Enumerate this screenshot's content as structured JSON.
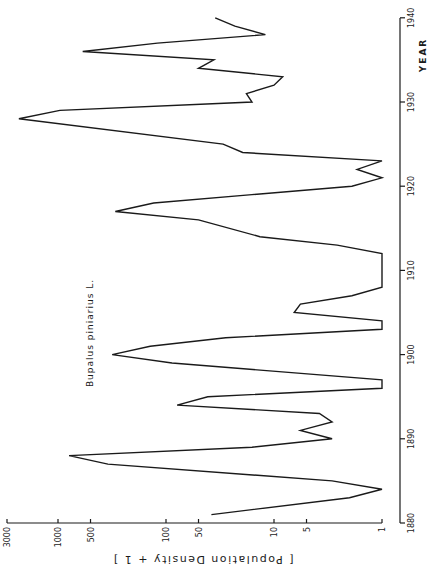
{
  "chart_data": {
    "type": "line",
    "title": "Bupalus piniarius L.",
    "orientation": "rotated 90° (years run bottom-to-top on right axis, values along bottom axis decreasing to the right)",
    "xlabel": "YEAR",
    "ylabel": "[ Population Density + 1 ]",
    "yscale": "log",
    "xlim": [
      1880,
      1940
    ],
    "ylim": [
      1,
      3000
    ],
    "x_ticks": [
      1880,
      1890,
      1900,
      1910,
      1920,
      1930,
      1940
    ],
    "y_ticks": [
      1,
      5,
      10,
      50,
      100,
      500,
      1000,
      3000
    ],
    "y_tick_labels": [
      "1",
      "5",
      "10",
      "50",
      "100",
      "500",
      "1000",
      "3000"
    ],
    "grid": false,
    "legend": null,
    "series": [
      {
        "name": "Bupalus piniarius L.",
        "x": [
          1881,
          1883,
          1884,
          1885,
          1887,
          1888,
          1889,
          1890,
          1891,
          1892,
          1893,
          1894,
          1895,
          1896,
          1897,
          1899,
          1900,
          1901,
          1902,
          1903,
          1904,
          1905,
          1906,
          1907,
          1908,
          1910,
          1912,
          1913,
          1914,
          1916,
          1917,
          1918,
          1919,
          1920,
          1921,
          1922,
          1923,
          1924,
          1925,
          1928,
          1929,
          1930,
          1931,
          1932,
          1933,
          1934,
          1935,
          1936,
          1937,
          1938,
          1939,
          1940
        ],
        "values": [
          38,
          2,
          1,
          2.9,
          345,
          790,
          16,
          2.9,
          5.7,
          2.9,
          3.8,
          79,
          41,
          1,
          1,
          88,
          315,
          140,
          28,
          1,
          1,
          6.5,
          5.7,
          1.9,
          1,
          1,
          1,
          2.6,
          13.5,
          50,
          295,
          130,
          16,
          1.9,
          1,
          1.7,
          1,
          19.5,
          29.6,
          2300,
          960,
          16,
          18,
          10,
          8.3,
          50,
          36,
          590,
          120,
          12,
          23,
          35
        ]
      }
    ]
  },
  "labels": {
    "species": "Bupalus piniarius L.",
    "x_axis_title": "YEAR",
    "y_axis_title": "[ Population Density + 1 ]"
  },
  "colors": {
    "line": "#1a1a1a",
    "background": "#ffffff"
  }
}
